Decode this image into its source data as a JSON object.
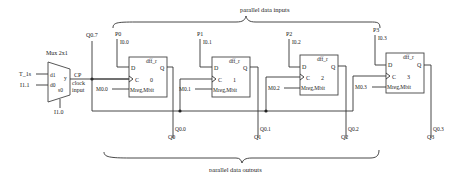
{
  "diagram": {
    "title_inputs": "parallel data inputs",
    "title_outputs": "parallel data outputs",
    "mux": {
      "label": "Mux 2x1",
      "in1_pin": "d1",
      "in0_pin": "d0",
      "sel_pin": "s0",
      "out_pin": "y",
      "in1_signal": "T_1s",
      "in0_signal": "I1.1",
      "sel_signal": "I1.0"
    },
    "clock": {
      "label": "CP",
      "sub1": "clock",
      "sub2": "input",
      "feedback_label": "Q0.7"
    },
    "flipflops": [
      {
        "name": "dff_r",
        "index": "0",
        "d": "D",
        "c": "C",
        "q": "Q",
        "mreg": "Mreg,Mbit",
        "parallel_label": "P0",
        "input_addr": "I0.0",
        "mbit_addr": "M0.0",
        "q_addr": "Q0.0",
        "q_label": "Q0"
      },
      {
        "name": "dff_r",
        "index": "1",
        "d": "D",
        "c": "C",
        "q": "Q",
        "mreg": "Mreg,Mbit",
        "parallel_label": "P1",
        "input_addr": "I0.1",
        "mbit_addr": "M0.1",
        "q_addr": "Q0.1",
        "q_label": "Q1"
      },
      {
        "name": "dff_r",
        "index": "2",
        "d": "D",
        "c": "C",
        "q": "Q",
        "mreg": "Mreg,Mbit",
        "parallel_label": "P2",
        "input_addr": "I0.2",
        "mbit_addr": "M0.2",
        "q_addr": "Q0.2",
        "q_label": "Q2"
      },
      {
        "name": "dff_r",
        "index": "3",
        "d": "D",
        "c": "C",
        "q": "Q",
        "mreg": "Mreg,Mbit",
        "parallel_label": "P3",
        "input_addr": "I0.3",
        "mbit_addr": "M0.3",
        "q_addr": "Q0.3",
        "q_label": "Q3"
      }
    ],
    "colors": {
      "line": "#333333",
      "text": "#222222",
      "background": "#ffffff"
    }
  }
}
